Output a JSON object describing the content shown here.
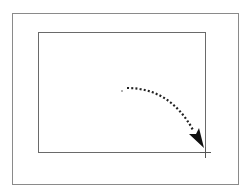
{
  "diagram": {
    "outer_frame": {
      "x": 12,
      "y": 13,
      "width": 226,
      "height": 171,
      "stroke": "#8a8a8a"
    },
    "inner_frame": {
      "x": 38,
      "y": 32,
      "width": 167,
      "height": 120,
      "stroke": "#6a6a6a"
    },
    "drag_start": {
      "x": 122,
      "y": 91
    },
    "drag_end": {
      "x": 204,
      "y": 148
    },
    "crosshair": {
      "x": 206,
      "y": 152
    },
    "colors": {
      "background": "#ffffff",
      "path": "#222222",
      "arrowhead": "#111111"
    }
  }
}
